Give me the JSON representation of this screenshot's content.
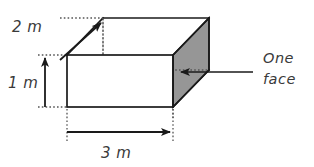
{
  "figure": {
    "shape": "rectangular prism",
    "background_color": "#ffffff",
    "line_color": "#1a1a1a",
    "guide_color": "#555555",
    "shaded_face_color": "#969696",
    "text_color": "#3a3a3a",
    "dimensions": [
      {
        "id": "depth",
        "label": "2 m",
        "value": 2,
        "unit": "m",
        "axis": "depth",
        "arrow_direction": "up-right"
      },
      {
        "id": "height",
        "label": "1 m",
        "value": 1,
        "unit": "m",
        "axis": "height",
        "arrow_direction": "up"
      },
      {
        "id": "width",
        "label": "3 m",
        "value": 3,
        "unit": "m",
        "axis": "width",
        "arrow_direction": "right"
      }
    ],
    "callout": {
      "line1": "One",
      "line2": "face",
      "target": "shaded right face",
      "arrow_direction": "left"
    }
  }
}
